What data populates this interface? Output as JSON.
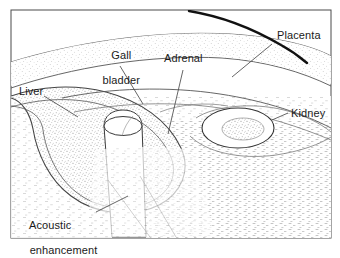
{
  "figure": {
    "name": "ultrasound-line-drawing-abdomen",
    "border_color": "#4a4a4a",
    "ink_color": "#222222",
    "stipple_color": "#8c8c8c",
    "background": "#ffffff"
  },
  "labels": {
    "gall_bladder": {
      "line1": "Gall",
      "line2": "bladder"
    },
    "adrenal": {
      "text": "Adrenal"
    },
    "placenta": {
      "text": "Placenta"
    },
    "kidney": {
      "text": "Kidney"
    },
    "liver": {
      "text": "Liver"
    },
    "acoustic_enhancement": {
      "line1": "Acoustic",
      "line2": "enhancement"
    }
  },
  "structures": [
    {
      "name": "transducer-skin-arc"
    },
    {
      "name": "placenta-band"
    },
    {
      "name": "liver-outline"
    },
    {
      "name": "gallbladder-outline"
    },
    {
      "name": "kidney-outline"
    },
    {
      "name": "kidney-sinus"
    },
    {
      "name": "adrenal-region"
    },
    {
      "name": "acoustic-enhancement-shadow"
    }
  ]
}
